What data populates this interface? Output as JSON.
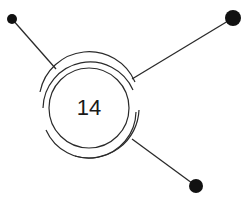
{
  "diagram": {
    "center_label": "14",
    "colors": {
      "stroke": "#2a2a2a",
      "node": "#111111",
      "background": "#ffffff"
    },
    "nodes": [
      {
        "name": "top-left-node",
        "x": 12,
        "y": 19,
        "r": 5
      },
      {
        "name": "top-right-node",
        "x": 233,
        "y": 18,
        "r": 8
      },
      {
        "name": "bottom-right-node",
        "x": 196,
        "y": 186,
        "r": 7
      }
    ]
  }
}
